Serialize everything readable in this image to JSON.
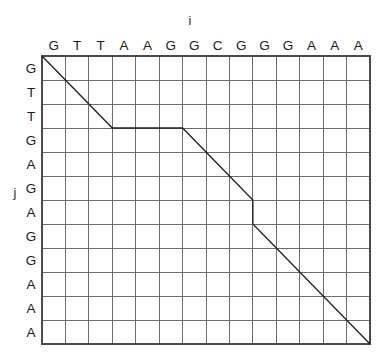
{
  "figure": {
    "title": "",
    "type": "sequence-alignment-dot-matrix",
    "axes": {
      "x_axis_label": "i",
      "y_axis_label": "j"
    },
    "sequence_i": {
      "name": "i",
      "residues": [
        "G",
        "T",
        "T",
        "A",
        "A",
        "G",
        "G",
        "C",
        "G",
        "G",
        "G",
        "A",
        "A",
        "A"
      ],
      "length": 14
    },
    "sequence_j": {
      "name": "j",
      "residues": [
        "G",
        "T",
        "T",
        "G",
        "A",
        "G",
        "A",
        "G",
        "G",
        "A",
        "A",
        "A"
      ],
      "length": 12
    },
    "grid": {
      "columns": 14,
      "rows": 12,
      "line_color": "#6e6e6e",
      "border_color": "#4a4a4a",
      "background_color": "#ffffff"
    },
    "alignment_path": {
      "color": "#222222",
      "description": "traceback path through the alignment matrix",
      "segments": [
        {
          "kind": "diagonal",
          "from": [
            0,
            0
          ],
          "to": [
            3,
            3
          ]
        },
        {
          "kind": "horizontal",
          "from": [
            3,
            3
          ],
          "to": [
            6,
            3
          ]
        },
        {
          "kind": "diagonal",
          "from": [
            6,
            3
          ],
          "to": [
            9,
            6
          ]
        },
        {
          "kind": "vertical",
          "from": [
            9,
            6
          ],
          "to": [
            9,
            7
          ]
        },
        {
          "kind": "diagonal",
          "from": [
            9,
            7
          ],
          "to": [
            14,
            12
          ]
        }
      ],
      "vertices": [
        [
          0,
          0
        ],
        [
          3,
          3
        ],
        [
          6,
          3
        ],
        [
          9,
          6
        ],
        [
          9,
          7
        ],
        [
          14,
          12
        ]
      ]
    }
  },
  "chart_data": {
    "type": "table",
    "title": "",
    "xlabel": "i",
    "ylabel": "j",
    "categories": [
      "G",
      "T",
      "T",
      "A",
      "A",
      "G",
      "G",
      "C",
      "G",
      "G",
      "G",
      "A",
      "A",
      "A"
    ],
    "row_categories": [
      "G",
      "T",
      "T",
      "G",
      "A",
      "G",
      "A",
      "G",
      "G",
      "A",
      "A",
      "A"
    ],
    "grid": true,
    "legend": "none",
    "annotations": [
      {
        "label": "alignment path",
        "points": [
          [
            0,
            0
          ],
          [
            3,
            3
          ],
          [
            6,
            3
          ],
          [
            9,
            6
          ],
          [
            9,
            7
          ],
          [
            14,
            12
          ]
        ]
      }
    ]
  }
}
